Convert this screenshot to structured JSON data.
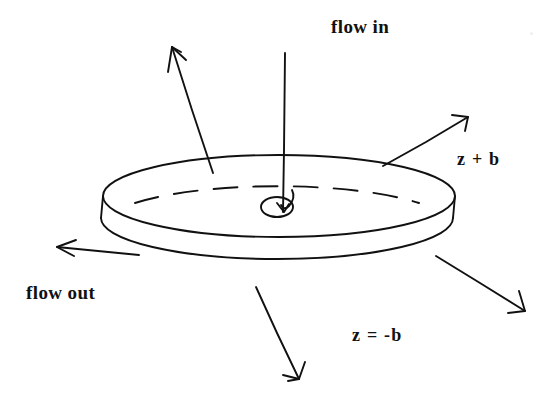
{
  "figure": {
    "title_text": "flow in",
    "background_color": "#ffffff",
    "ink_color": "#111111",
    "labels": {
      "flow_in": "flow in",
      "flow_out": "flow out",
      "top_surface": "z + b",
      "bottom_surface": "z = -b"
    },
    "geometry": {
      "top_ellipse": {
        "cx": 279,
        "cy": 196,
        "rx": 176,
        "ry": 41
      },
      "bottom_ellipse": {
        "cx": 277,
        "cy": 218,
        "rx": 176,
        "ry": 41
      },
      "hole_ellipse": {
        "cx": 277,
        "cy": 207,
        "rx": 16,
        "ry": 10
      },
      "disk_thickness": 22
    },
    "arrows": [
      {
        "name": "flow-in-axis",
        "from": [
          285,
          53
        ],
        "to": [
          283,
          212
        ],
        "head": "small-hook"
      },
      {
        "name": "outflow-upper-left",
        "from": [
          213,
          173
        ],
        "to": [
          172,
          47
        ],
        "head": "open"
      },
      {
        "name": "outflow-upper-right",
        "from": [
          383,
          166
        ],
        "to": [
          468,
          117
        ],
        "head": "open"
      },
      {
        "name": "outflow-left",
        "from": [
          139,
          255
        ],
        "to": [
          57,
          247
        ],
        "head": "open"
      },
      {
        "name": "outflow-lower-right",
        "from": [
          436,
          256
        ],
        "to": [
          525,
          311
        ],
        "head": "open"
      },
      {
        "name": "outflow-lower-center",
        "from": [
          256,
          287
        ],
        "to": [
          299,
          379
        ],
        "head": "open"
      }
    ]
  }
}
